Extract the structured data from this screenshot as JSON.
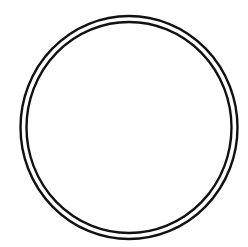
{
  "figure": {
    "background": "#ffffff",
    "shape": "double-ring circle",
    "outer_ring": {
      "cx": 129,
      "cy": 127.5,
      "rx": 108.5,
      "ry": 111.5,
      "stroke": "#111111",
      "stroke_width": 2.4
    },
    "inner_ring": {
      "cx": 129,
      "cy": 127.5,
      "rx": 102.5,
      "ry": 105.5,
      "stroke": "#111111",
      "stroke_width": 2.4
    }
  }
}
